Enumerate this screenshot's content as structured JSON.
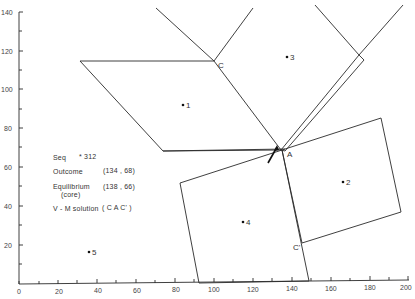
{
  "figure": {
    "x_axis": {
      "ticks": [
        "0",
        "20",
        "40",
        "60",
        "80",
        "100",
        "120",
        "140",
        "160",
        "180",
        "200"
      ],
      "range": [
        0,
        200
      ]
    },
    "y_axis": {
      "ticks": [
        "20",
        "40",
        "60",
        "80",
        "100",
        "120",
        "140"
      ],
      "range": [
        0,
        140
      ]
    },
    "vertices": {
      "A": "A",
      "C": "C",
      "C_prime": "C'"
    },
    "points": [
      {
        "label": "1",
        "x": 84,
        "y": 92
      },
      {
        "label": "2",
        "x": 166,
        "y": 52
      },
      {
        "label": "3",
        "x": 138,
        "y": 117
      },
      {
        "label": "4",
        "x": 115,
        "y": 32
      },
      {
        "label": "5",
        "x": 36,
        "y": 16
      },
      {
        "label": "312",
        "x": 32,
        "y": 65
      }
    ],
    "legend": {
      "seq_label": "Seq",
      "seq_value": "* 312",
      "outcome_label": "Outcome",
      "outcome_value": "(134 , 68)",
      "equilibrium_label": "Equilibrium",
      "equilibrium_sub": "(core)",
      "equilibrium_value": "(138 , 66)",
      "vm_label": "V - M solution",
      "vm_value": "( C A C' )"
    }
  }
}
